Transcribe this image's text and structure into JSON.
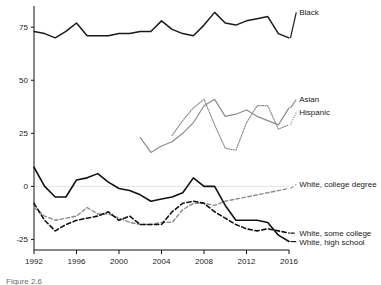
{
  "figure": {
    "caption": "Figure 2.6"
  },
  "chart_data": {
    "type": "line",
    "title": "",
    "xlabel": "",
    "ylabel": "",
    "xlim": [
      1992,
      2016
    ],
    "ylim": [
      -30,
      85
    ],
    "grid": false,
    "zero_line": true,
    "legend_position": "right-inline",
    "yticks": [
      -25,
      0,
      25,
      50,
      75
    ],
    "ytick_labels": [
      "-25",
      "0",
      "25",
      "50",
      "75"
    ],
    "xticks": [
      1992,
      1996,
      2000,
      2004,
      2008,
      2012,
      2016
    ],
    "xtick_labels": [
      "1992",
      "1996",
      "2000",
      "2004",
      "2008",
      "2012",
      "2016"
    ],
    "series": [
      {
        "name": "Black",
        "label": "Black",
        "color": "#1a1a1a",
        "style": "solid",
        "width": 1.5,
        "label_x": 2016.4,
        "label_y": 81,
        "x": [
          1992,
          1993,
          1994,
          1995,
          1996,
          1997,
          1998,
          1999,
          2000,
          2001,
          2002,
          2003,
          2004,
          2005,
          2006,
          2007,
          2008,
          2009,
          2010,
          2011,
          2012,
          2013,
          2014,
          2015,
          2016
        ],
        "y": [
          73,
          72,
          70,
          73,
          77,
          71,
          71,
          71,
          72,
          72,
          73,
          73,
          78,
          74,
          72,
          71,
          76,
          82,
          77,
          76,
          78,
          79,
          80,
          72,
          70
        ]
      },
      {
        "name": "Asian",
        "label": "Asian",
        "color": "#8c8c8c",
        "style": "solid",
        "width": 1.2,
        "label_x": 2016.4,
        "label_y": 40,
        "x": [
          2002,
          2003,
          2004,
          2005,
          2006,
          2007,
          2008,
          2009,
          2010,
          2011,
          2012,
          2013,
          2014,
          2015,
          2016
        ],
        "y": [
          23,
          16,
          19,
          21,
          25,
          30,
          38,
          41,
          33,
          34,
          36,
          33,
          31,
          29,
          37
        ]
      },
      {
        "name": "Hispanic",
        "label": "Hispanic",
        "color": "#8c8c8c",
        "style": "dotted",
        "width": 1.2,
        "label_x": 2016.4,
        "label_y": 34,
        "x": [
          2005,
          2006,
          2007,
          2008,
          2009,
          2010,
          2011,
          2012,
          2013,
          2014,
          2015,
          2016
        ],
        "y": [
          24,
          31,
          37,
          41,
          29,
          18,
          17,
          30,
          38,
          38,
          27,
          29
        ]
      },
      {
        "name": "White, college degree",
        "label": "White, college degree",
        "color": "#8c8c8c",
        "style": "dashed",
        "width": 1.4,
        "label_x": 2016.4,
        "label_y": 0,
        "x": [
          1992,
          1993,
          1994,
          1995,
          1996,
          1997,
          1998,
          1999,
          2000,
          2001,
          2002,
          2003,
          2004,
          2005,
          2006,
          2007,
          2008,
          2009,
          2010,
          2011,
          2012,
          2013,
          2014,
          2015,
          2016
        ],
        "y": [
          -10,
          -14,
          -16,
          -15,
          -14,
          -10,
          -13,
          -13,
          -15,
          -17,
          -18,
          -18,
          -17,
          -17,
          -11,
          -8,
          -8,
          -9,
          -7,
          -6,
          -5,
          -4,
          -3,
          -2,
          -1
        ]
      },
      {
        "name": "White, some college",
        "label": "White, some college",
        "color": "#111111",
        "style": "dashed",
        "width": 1.6,
        "label_x": 2016.4,
        "label_y": -23,
        "x": [
          1992,
          1993,
          1994,
          1995,
          1996,
          1997,
          1998,
          1999,
          2000,
          2001,
          2002,
          2003,
          2004,
          2005,
          2006,
          2007,
          2008,
          2009,
          2010,
          2011,
          2012,
          2013,
          2014,
          2015,
          2016
        ],
        "y": [
          -8,
          -16,
          -21,
          -18,
          -16,
          -15,
          -14,
          -12,
          -16,
          -14,
          -18,
          -18,
          -18,
          -12,
          -8,
          -7,
          -8,
          -12,
          -15,
          -18,
          -20,
          -21,
          -20,
          -21,
          -22
        ]
      },
      {
        "name": "White, high school",
        "label": "White, high school",
        "color": "#111111",
        "style": "solid",
        "width": 1.6,
        "label_x": 2016.4,
        "label_y": -27,
        "x": [
          1992,
          1993,
          1994,
          1995,
          1996,
          1997,
          1998,
          1999,
          2000,
          2001,
          2002,
          2003,
          2004,
          2005,
          2006,
          2007,
          2008,
          2009,
          2010,
          2011,
          2012,
          2013,
          2014,
          2015,
          2016
        ],
        "y": [
          9,
          0,
          -5,
          -5,
          3,
          4,
          6,
          2,
          -1,
          -2,
          -4,
          -7,
          -6,
          -5,
          -3,
          4,
          0,
          0,
          -9,
          -16,
          -16,
          -16,
          -17,
          -23,
          -26
        ]
      }
    ]
  }
}
